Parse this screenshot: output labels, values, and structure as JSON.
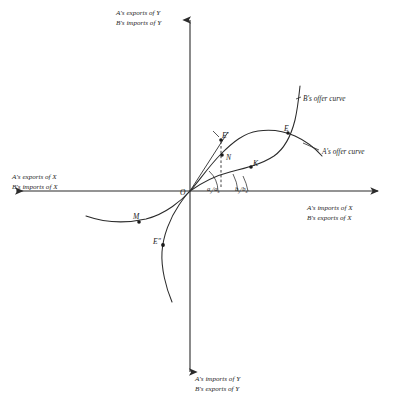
{
  "figure": {
    "type": "diagram",
    "background_color": "#ffffff",
    "ink_color": "#2b2b2b"
  },
  "axes": {
    "origin_label": "O",
    "top": {
      "line1": "A's exports of Y",
      "line2": "B's imports of Y"
    },
    "bottom": {
      "line1": "A's imports of Y",
      "line2": "B's exports of Y"
    },
    "left": {
      "line1": "A's exports of X",
      "line2": "B's imports of X"
    },
    "right": {
      "line1": "A's imports of X",
      "line2": "B's exports of X"
    }
  },
  "curves": [
    {
      "id": "a-offer-curve",
      "label": "A's offer curve"
    },
    {
      "id": "b-offer-curve",
      "label": "B's offer curve"
    }
  ],
  "points": [
    {
      "id": "point-e",
      "label": "E"
    },
    {
      "id": "point-e-prime",
      "label": "E'"
    },
    {
      "id": "point-n",
      "label": "N"
    },
    {
      "id": "point-k",
      "label": "K"
    },
    {
      "id": "point-m",
      "label": "M"
    },
    {
      "id": "point-e-dprime",
      "label": "E″"
    }
  ],
  "ratios": [
    {
      "id": "ratio-a",
      "numerator": "a",
      "numerator_sub": "y",
      "slash": "/",
      "denominator": "a",
      "denominator_sub": "x"
    },
    {
      "id": "ratio-b",
      "numerator": "b",
      "numerator_sub": "y",
      "slash": "/",
      "denominator": "b",
      "denominator_sub": "x"
    }
  ]
}
